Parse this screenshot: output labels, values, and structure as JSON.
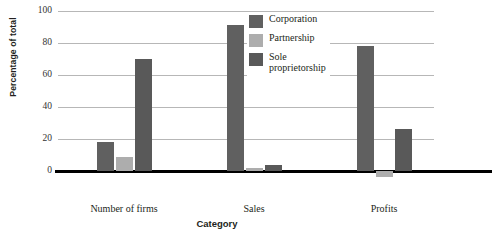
{
  "chart_data": {
    "type": "bar",
    "title": "",
    "xlabel": "Category",
    "ylabel": "Percentage of total",
    "categories": [
      "Number of firms",
      "Sales",
      "Profits"
    ],
    "series": [
      {
        "name": "Corporation",
        "color": "#606060",
        "values": [
          18,
          91,
          78
        ]
      },
      {
        "name": "Partnership",
        "color": "#adadad",
        "values": [
          9,
          2,
          -4
        ]
      },
      {
        "name": "Sole\nproprietorship",
        "color": "#595959",
        "values": [
          70,
          4,
          26
        ]
      }
    ],
    "yticks": [
      0,
      20,
      40,
      60,
      80,
      100
    ],
    "ytick_labels": [
      "0",
      "20",
      "40",
      "60",
      "80",
      "100"
    ],
    "ylim": [
      -10,
      100
    ],
    "grid": true,
    "legend_position": "top-center-right",
    "zero_line_color": "#000000",
    "gridline_color": "#b7b7b7"
  },
  "legend": {
    "items": [
      {
        "label": "Corporation"
      },
      {
        "label": "Partnership"
      },
      {
        "label": "Sole\nproprietorship"
      }
    ]
  }
}
